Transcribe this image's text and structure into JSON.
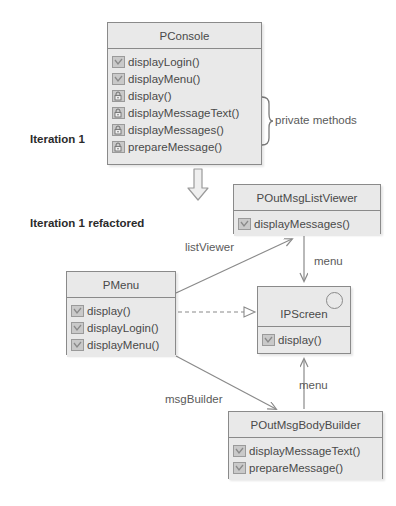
{
  "diagram": {
    "background": "#ffffff",
    "box_fill": "#e9e9e9",
    "box_stroke": "#8a8a8a",
    "text_color": "#4a4a4a",
    "edge_color": "#8a8a8a"
  },
  "section_labels": [
    {
      "text": "Iteration 1",
      "x": 30,
      "y": 133
    },
    {
      "text": "Iteration 1 refactored",
      "x": 30,
      "y": 217
    }
  ],
  "brace_label": {
    "text": "private methods",
    "x": 275,
    "y": 121
  },
  "classes": {
    "pconsole": {
      "name": "PConsole",
      "stereotype": "class",
      "x": 107,
      "y": 22,
      "width": 155,
      "height": 143,
      "members": [
        {
          "label": "displayLogin()",
          "visibility": "public"
        },
        {
          "label": "displayMenu()",
          "visibility": "public"
        },
        {
          "label": "display()",
          "visibility": "private"
        },
        {
          "label": "displayMessageText()",
          "visibility": "private"
        },
        {
          "label": "displayMessages()",
          "visibility": "private"
        },
        {
          "label": "prepareMessage()",
          "visibility": "private"
        }
      ]
    },
    "poutmsglistviewer": {
      "name": "POutMsgListViewer",
      "stereotype": "class",
      "x": 233,
      "y": 184,
      "width": 148,
      "height": 50,
      "members": [
        {
          "label": "displayMessages()",
          "visibility": "public"
        }
      ]
    },
    "pmenu": {
      "name": "PMenu",
      "stereotype": "class",
      "x": 66,
      "y": 271,
      "width": 110,
      "height": 84,
      "members": [
        {
          "label": "display()",
          "visibility": "public"
        },
        {
          "label": "displayLogin()",
          "visibility": "public"
        },
        {
          "label": "displayMenu()",
          "visibility": "public"
        }
      ]
    },
    "ipscreen": {
      "name": "IPScreen",
      "stereotype": "interface",
      "x": 257,
      "y": 286,
      "width": 94,
      "height": 68,
      "members": [
        {
          "label": "display()",
          "visibility": "public"
        }
      ]
    },
    "poutmsgbodybuilder": {
      "name": "POutMsgBodyBuilder",
      "stereotype": "class",
      "x": 228,
      "y": 411,
      "width": 155,
      "height": 68,
      "members": [
        {
          "label": "displayMessageText()",
          "visibility": "public"
        },
        {
          "label": "prepareMessage()",
          "visibility": "public"
        }
      ]
    }
  },
  "edges": [
    {
      "name": "pmenu-to-listviewer",
      "label": "listViewer",
      "label_x": 185,
      "label_y": 248,
      "kind": "association-directed"
    },
    {
      "name": "listviewer-to-ipscreen",
      "label": "menu",
      "label_x": 314,
      "label_y": 262,
      "kind": "association-directed"
    },
    {
      "name": "pmenu-to-ipscreen",
      "label": "",
      "label_x": 0,
      "label_y": 0,
      "kind": "realization-dashed"
    },
    {
      "name": "bodybuilder-to-ipscreen",
      "label": "menu",
      "label_x": 299,
      "label_y": 386,
      "kind": "association-directed"
    },
    {
      "name": "pmenu-to-bodybuilder",
      "label": "msgBuilder",
      "label_x": 165,
      "label_y": 400,
      "kind": "association-directed"
    }
  ],
  "refactor_arrow": {
    "name": "refactor-block-arrow",
    "x": 186,
    "y": 168,
    "width": 24,
    "height": 34
  }
}
